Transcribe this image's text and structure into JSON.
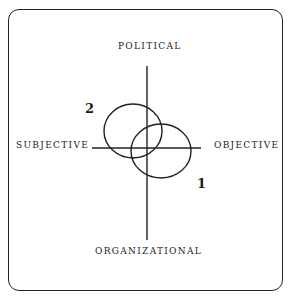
{
  "diagram": {
    "axes": {
      "top": "POLITICAL",
      "bottom": "ORGANIZATIONAL",
      "left": "SUBJECTIVE",
      "right": "OBJECTIVE"
    },
    "circles": [
      {
        "label": "1",
        "cx": 161,
        "cy": 151,
        "rx": 30,
        "ry": 27
      },
      {
        "label": "2",
        "cx": 133,
        "cy": 131,
        "rx": 29,
        "ry": 27
      }
    ],
    "colors": {
      "stroke": "#222222",
      "background": "#ffffff"
    }
  }
}
